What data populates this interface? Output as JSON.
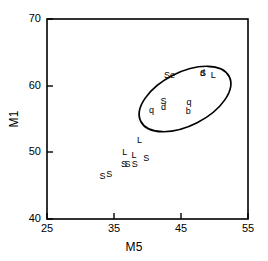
{
  "chart_data": {
    "type": "scatter",
    "title": "",
    "xlabel": "M5",
    "ylabel": "M1",
    "xlim": [
      25,
      55
    ],
    "ylim": [
      40,
      70
    ],
    "xticks": [
      25,
      35,
      45,
      55
    ],
    "yticks": [
      40,
      50,
      60,
      70
    ],
    "grid": false,
    "legend": null,
    "marker_style": "text-letter",
    "annotations": [
      {
        "kind": "ellipse",
        "center_x": 45.6,
        "center_y": 58.0,
        "rx": 7.4,
        "ry": 4.0,
        "rotation_deg": -27,
        "note": "cluster outline"
      }
    ],
    "points": [
      {
        "label": "Se",
        "x": 43.3,
        "y": 61.6
      },
      {
        "label": "d",
        "x": 48.2,
        "y": 61.9
      },
      {
        "label": "S",
        "x": 48.3,
        "y": 61.9
      },
      {
        "label": "L",
        "x": 49.8,
        "y": 61.6
      },
      {
        "label": "S",
        "x": 42.4,
        "y": 57.7
      },
      {
        "label": "d",
        "x": 42.4,
        "y": 56.8
      },
      {
        "label": "q",
        "x": 40.6,
        "y": 56.3
      },
      {
        "label": "q",
        "x": 46.2,
        "y": 57.6
      },
      {
        "label": "b",
        "x": 46.1,
        "y": 56.2
      },
      {
        "label": "L",
        "x": 38.8,
        "y": 51.8
      },
      {
        "label": "L",
        "x": 36.6,
        "y": 50.0
      },
      {
        "label": "L",
        "x": 38.0,
        "y": 49.6
      },
      {
        "label": "S",
        "x": 39.8,
        "y": 49.1
      },
      {
        "label": "S",
        "x": 36.5,
        "y": 48.2
      },
      {
        "label": "S",
        "x": 37.0,
        "y": 48.2
      },
      {
        "label": "S",
        "x": 38.1,
        "y": 48.2
      },
      {
        "label": "S",
        "x": 33.3,
        "y": 46.5
      },
      {
        "label": "S",
        "x": 34.3,
        "y": 46.8
      }
    ]
  },
  "frame": {
    "left_px": 47,
    "right_px": 248,
    "top_px": 19,
    "bottom_px": 219
  },
  "axis": {
    "x_title": "M5",
    "y_title": "M1",
    "x_tick_labels": [
      "25",
      "35",
      "45",
      "55"
    ],
    "y_tick_labels": [
      "40",
      "50",
      "60",
      "70"
    ]
  },
  "colors": {
    "frame": "#000000",
    "text": "#000000",
    "ellipse": "#000000",
    "background": "#ffffff"
  }
}
